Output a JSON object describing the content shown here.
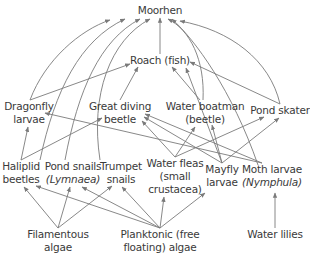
{
  "colors": {
    "text": "#3a3a3a",
    "arrow": "#7a7a7a",
    "background": "#ffffff"
  },
  "nodes": {
    "moorhen": {
      "lines": [
        "Moorhen"
      ],
      "x": 160,
      "y": 4
    },
    "roach": {
      "lines": [
        "Roach (fish)"
      ],
      "x": 160,
      "y": 54
    },
    "dragonfly": {
      "lines": [
        "Dragonfly",
        "larvae"
      ],
      "x": 29,
      "y": 100
    },
    "great_diving_beetle": {
      "lines": [
        "Great diving",
        "beetle"
      ],
      "x": 120,
      "y": 100
    },
    "water_boatman": {
      "lines": [
        "Water boatman",
        "(beetle)"
      ],
      "x": 205,
      "y": 100
    },
    "pond_skater": {
      "lines": [
        "Pond skater"
      ],
      "x": 280,
      "y": 104
    },
    "haliplid": {
      "lines": [
        "Haliplid",
        "beetles"
      ],
      "x": 21,
      "y": 160
    },
    "pond_snails": {
      "lines": [
        "Pond snails",
        "(Lymnaea)"
      ],
      "x": 73,
      "y": 160,
      "italic_line": 1
    },
    "trumpet_snails": {
      "lines": [
        "Trumpet",
        "snails"
      ],
      "x": 121,
      "y": 160
    },
    "water_fleas": {
      "lines": [
        "Water fleas",
        "(small",
        "crustacea)"
      ],
      "x": 175,
      "y": 157
    },
    "mayfly": {
      "lines": [
        "Mayfly",
        "larvae"
      ],
      "x": 222,
      "y": 163
    },
    "moth_larvae": {
      "lines": [
        "Moth larvae",
        "(Nymphula)"
      ],
      "x": 272,
      "y": 163,
      "italic_line": 1
    },
    "filamentous_algae": {
      "lines": [
        "Filamentous",
        "algae"
      ],
      "x": 58,
      "y": 228
    },
    "planktonic_algae": {
      "lines": [
        "Planktonic (free",
        "floating) algae"
      ],
      "x": 160,
      "y": 228
    },
    "water_lilies": {
      "lines": [
        "Water lilies"
      ],
      "x": 275,
      "y": 228
    }
  },
  "edges": [
    {
      "from": "roach",
      "to": "moorhen"
    },
    {
      "from": "dragonfly",
      "to": "moorhen"
    },
    {
      "from": "haliplid",
      "to": "moorhen"
    },
    {
      "from": "pond_snails",
      "to": "moorhen"
    },
    {
      "from": "trumpet_snails",
      "to": "moorhen"
    },
    {
      "from": "water_boatman",
      "to": "moorhen"
    },
    {
      "from": "moth_larvae",
      "to": "moorhen"
    },
    {
      "from": "pond_skater",
      "to": "moorhen"
    },
    {
      "from": "dragonfly",
      "to": "roach"
    },
    {
      "from": "great_diving_beetle",
      "to": "roach"
    },
    {
      "from": "water_boatman",
      "to": "roach"
    },
    {
      "from": "mayfly",
      "to": "roach"
    },
    {
      "from": "pond_skater",
      "to": "roach"
    },
    {
      "from": "haliplid",
      "to": "dragonfly"
    },
    {
      "from": "moth_larvae",
      "to": "dragonfly"
    },
    {
      "from": "haliplid",
      "to": "great_diving_beetle"
    },
    {
      "from": "water_fleas",
      "to": "great_diving_beetle"
    },
    {
      "from": "mayfly",
      "to": "great_diving_beetle"
    },
    {
      "from": "moth_larvae",
      "to": "great_diving_beetle"
    },
    {
      "from": "water_fleas",
      "to": "water_boatman"
    },
    {
      "from": "mayfly",
      "to": "water_boatman"
    },
    {
      "from": "water_fleas",
      "to": "pond_skater"
    },
    {
      "from": "mayfly",
      "to": "pond_skater"
    },
    {
      "from": "filamentous_algae",
      "to": "haliplid"
    },
    {
      "from": "filamentous_algae",
      "to": "pond_snails"
    },
    {
      "from": "filamentous_algae",
      "to": "trumpet_snails"
    },
    {
      "from": "planktonic_algae",
      "to": "haliplid"
    },
    {
      "from": "planktonic_algae",
      "to": "pond_snails"
    },
    {
      "from": "planktonic_algae",
      "to": "trumpet_snails"
    },
    {
      "from": "planktonic_algae",
      "to": "water_fleas"
    },
    {
      "from": "planktonic_algae",
      "to": "mayfly"
    },
    {
      "from": "water_lilies",
      "to": "moth_larvae"
    }
  ]
}
